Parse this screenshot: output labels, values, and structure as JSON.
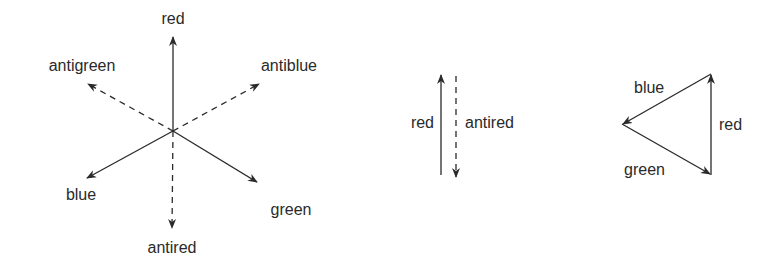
{
  "figure": {
    "star": {
      "center": [
        173,
        131
      ],
      "vectors": [
        {
          "name": "red",
          "label": "red",
          "tip": [
            173,
            36
          ],
          "style": "solid",
          "label_pos": [
            173,
            24
          ],
          "anchor": "middle"
        },
        {
          "name": "blue",
          "label": "blue",
          "tip": [
            86,
            178
          ],
          "style": "solid",
          "label_pos": [
            81,
            200
          ],
          "anchor": "middle"
        },
        {
          "name": "green",
          "label": "green",
          "tip": [
            257,
            182
          ],
          "style": "solid",
          "label_pos": [
            291,
            215
          ],
          "anchor": "middle"
        },
        {
          "name": "antired",
          "label": "antired",
          "tip": [
            172,
            229
          ],
          "style": "dashed",
          "label_pos": [
            172,
            253
          ],
          "anchor": "middle"
        },
        {
          "name": "antigreen",
          "label": "antigreen",
          "tip": [
            87,
            83
          ],
          "style": "dashed",
          "label_pos": [
            82,
            70
          ],
          "anchor": "middle"
        },
        {
          "name": "antiblue",
          "label": "antiblue",
          "tip": [
            260,
            83
          ],
          "style": "dashed",
          "label_pos": [
            289,
            70
          ],
          "anchor": "middle"
        }
      ]
    },
    "pair": {
      "red_label": "red",
      "antired_label": "antired"
    },
    "triangle": {
      "blue_label": "blue",
      "red_label": "red",
      "green_label": "green"
    }
  }
}
